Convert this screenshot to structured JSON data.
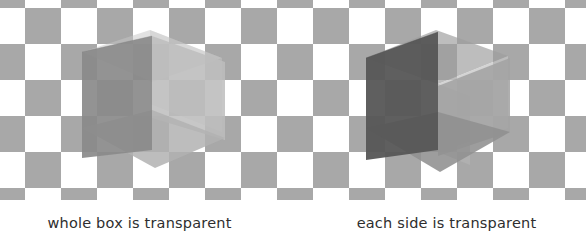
{
  "figure": {
    "width": 586,
    "height": 246,
    "background_color": "#ffffff"
  },
  "checkerboard": {
    "cell_size": 36,
    "origin_x": 25,
    "origin_y": 8,
    "columns": 16,
    "rows": 6,
    "light_color": "#ffffff",
    "dark_color": "#a8a8a8",
    "area_height": 200
  },
  "cubes": [
    {
      "name": "whole-box-transparent-cube",
      "caption": "whole box is transparent",
      "center_x": 150,
      "center_y": 105,
      "description": "Wireframe box drawn as a single translucent volume; overlapping faces do not accumulate opacity.",
      "faces": [
        {
          "name": "left-face",
          "fill": "#8a8a8a",
          "opacity": 0.88
        },
        {
          "name": "right-face",
          "fill": "#bdbdbd",
          "opacity": 0.8
        },
        {
          "name": "bottom-face",
          "fill": "#b0b0b0",
          "opacity": 0.8
        },
        {
          "name": "top-face",
          "fill": "#c6c6c6",
          "opacity": 0.55
        },
        {
          "name": "back-face",
          "fill": "#c2c2c2",
          "opacity": 0.45
        }
      ]
    },
    {
      "name": "each-side-transparent-cube",
      "caption": "each side is transparent",
      "center_x": 435,
      "center_y": 105,
      "description": "Each of the six sides is drawn translucently, so overlapping sides darken where they stack.",
      "faces": [
        {
          "name": "left-face",
          "fill": "#565656",
          "opacity": 0.94
        },
        {
          "name": "right-face",
          "fill": "#a0a0a0",
          "opacity": 0.88
        },
        {
          "name": "bottom-face",
          "fill": "#8f8f8f",
          "opacity": 0.88
        },
        {
          "name": "top-face",
          "fill": "#9a9a9a",
          "opacity": 0.7
        },
        {
          "name": "inner-back-face",
          "fill": "#c4c4c4",
          "opacity": 0.7
        },
        {
          "name": "inner-side-face",
          "fill": "#b5b5b5",
          "opacity": 0.7
        }
      ]
    }
  ],
  "captions": {
    "left": "whole box is transparent",
    "right": "each side is transparent",
    "text_color": "#2e2e2e"
  }
}
